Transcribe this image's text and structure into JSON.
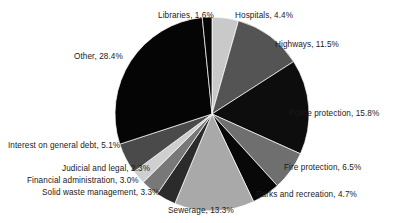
{
  "chart_data": {
    "type": "pie",
    "title": "",
    "subtitle": "",
    "xlabel": "",
    "ylabel": "",
    "legend_position": "none",
    "grid": false,
    "units": "percent",
    "start_angle_deg": 0,
    "direction": "clockwise",
    "categories": [
      "Hospitals",
      "Highways",
      "Police protection",
      "Fire protection",
      "Parks and recreation",
      "Sewerage",
      "Solid waste management",
      "Financial administration",
      "Judicial and legal",
      "Interest on general debt",
      "Other",
      "Libraries"
    ],
    "values": [
      4.4,
      11.5,
      15.8,
      6.5,
      4.7,
      13.3,
      3.3,
      3.0,
      2.3,
      5.1,
      28.4,
      1.6
    ],
    "colors": [
      "#c9c9c9",
      "#545454",
      "#0d0d0d",
      "#6f6f6f",
      "#080808",
      "#a9a9a9",
      "#2b2b2b",
      "#787878",
      "#cfcfcf",
      "#4a4a4a",
      "#050505",
      "#050505"
    ],
    "slices": [
      {
        "label": "Hospitals",
        "value": 4.4,
        "color": "#c9c9c9"
      },
      {
        "label": "Highways",
        "value": 11.5,
        "color": "#545454"
      },
      {
        "label": "Police protection",
        "value": 15.8,
        "color": "#0d0d0d"
      },
      {
        "label": "Fire protection",
        "value": 6.5,
        "color": "#6f6f6f"
      },
      {
        "label": "Parks and recreation",
        "value": 4.7,
        "color": "#080808"
      },
      {
        "label": "Sewerage",
        "value": 13.3,
        "color": "#a9a9a9"
      },
      {
        "label": "Solid waste management",
        "value": 3.3,
        "color": "#2b2b2b"
      },
      {
        "label": "Financial administration",
        "value": 3.0,
        "color": "#787878"
      },
      {
        "label": "Judicial and legal",
        "value": 2.3,
        "color": "#cfcfcf"
      },
      {
        "label": "Interest on general debt",
        "value": 5.1,
        "color": "#4a4a4a"
      },
      {
        "label": "Other",
        "value": 28.4,
        "color": "#050505"
      },
      {
        "label": "Libraries",
        "value": 1.6,
        "color": "#050505"
      }
    ]
  },
  "labels": {
    "libraries": "Libraries, 1.6%",
    "hospitals": "Hospitals, 4.4%",
    "highways": "Highways, 11.5%",
    "police": "Police protection, 15.8%",
    "fire": "Fire protection, 6.5%",
    "parks": "Parks and recreation, 4.7%",
    "sewerage": "Sewerage, 13.3%",
    "solid_waste": "Solid waste management, 3.3%",
    "financial": "Financial administration, 3.0%",
    "judicial": "Judicial and legal, 2.3%",
    "interest": "Interest on general debt, 5.1%",
    "other": "Other, 28.4%"
  },
  "background_color": "#ffffff",
  "text_color": "#1a1a1a"
}
